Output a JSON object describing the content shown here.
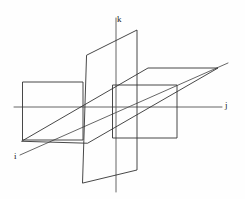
{
  "figure": {
    "background_color": "#fefefe",
    "stroke_color": "#333333",
    "stroke_width": 0.9,
    "axis_stroke_color": "#555555",
    "width": 245,
    "height": 199
  },
  "axes": [
    {
      "id": "k",
      "label": "k",
      "name": "k-axis",
      "direction": "vertical-up",
      "line": {
        "x1": 116,
        "y1": 18,
        "x2": 116,
        "y2": 192
      },
      "label_position": {
        "x": 117,
        "y": 15
      }
    },
    {
      "id": "j",
      "label": "j",
      "name": "j-axis",
      "direction": "horizontal-right",
      "line": {
        "x1": 14,
        "y1": 107,
        "x2": 222,
        "y2": 107
      },
      "label_position": {
        "x": 225,
        "y": 101
      }
    },
    {
      "id": "i",
      "label": "i",
      "name": "i-axis",
      "direction": "diagonal-front-left",
      "line": {
        "x1": 228,
        "y1": 63,
        "x2": 20,
        "y2": 155
      },
      "label_position": {
        "x": 14,
        "y": 152
      }
    }
  ],
  "planes": [
    {
      "id": "vertical-front",
      "name": "vertical-plane-front",
      "shape": "parallelogram",
      "points": "87,55 137,30 137,170 83,183"
    },
    {
      "id": "horizontal",
      "name": "horizontal-plane",
      "shape": "parallelogram",
      "points": "22,141 148,68 218,68 88,143"
    },
    {
      "id": "vertical-left",
      "name": "vertical-plane-left-wing",
      "shape": "rectangle",
      "points": "23,82 83,82 83,140 23,140"
    },
    {
      "id": "vertical-right",
      "name": "vertical-plane-right-wing",
      "shape": "rectangle",
      "points": "113,85 177,85 177,138 113,138"
    }
  ],
  "labels": {
    "k": "k",
    "j": "j",
    "i": "i"
  }
}
